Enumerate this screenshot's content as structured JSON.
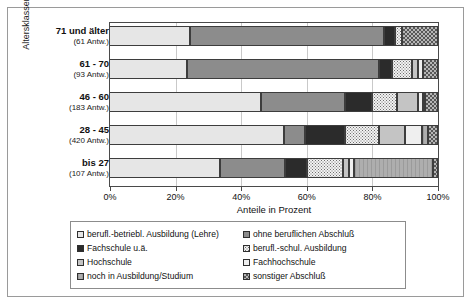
{
  "axis": {
    "y_title": "Altersklassen",
    "x_title": "Anteile in Prozent",
    "x_ticks": [
      "0%",
      "20%",
      "40%",
      "60%",
      "80%",
      "100%"
    ]
  },
  "categories": [
    {
      "name": "71 und älter",
      "count": "(61 Antw.)"
    },
    {
      "name": "61 - 70",
      "count": "(93 Antw.)"
    },
    {
      "name": "46 - 60",
      "count": "(183 Antw.)"
    },
    {
      "name": "28 - 45",
      "count": "(420 Antw.)"
    },
    {
      "name": "bis 27",
      "count": "(107 Antw.)"
    }
  ],
  "legend": [
    {
      "label": "berufl.-betriebl. Ausbildung (Lehre)",
      "swatch": "pattern-light-gray"
    },
    {
      "label": "ohne beruflichen Abschluß",
      "swatch": "pattern-mid-gray"
    },
    {
      "label": "Fachschule u.ä.",
      "swatch": "pattern-dark"
    },
    {
      "label": "berufl.-schul. Ausbildung",
      "swatch": "pattern-dotted"
    },
    {
      "label": "Hochschule",
      "swatch": "pattern-gray"
    },
    {
      "label": "Fachhochschule",
      "swatch": "pattern-white"
    },
    {
      "label": "noch in Ausbildung/Studium",
      "swatch": "pattern-vertical-lines"
    },
    {
      "label": "sonstiger Abschluß",
      "swatch": "pattern-checker"
    }
  ],
  "chart_data": {
    "type": "bar",
    "orientation": "horizontal",
    "stacked": "100%",
    "title": "",
    "xlabel": "Anteile in Prozent",
    "ylabel": "Altersklassen",
    "xlim": [
      0,
      100
    ],
    "xticks": [
      0,
      20,
      40,
      60,
      80,
      100
    ],
    "grid": "vertical",
    "legend_position": "bottom",
    "categories": [
      "71 und älter",
      "61 - 70",
      "46 - 60",
      "28 - 45",
      "bis 27"
    ],
    "category_counts": [
      61,
      93,
      183,
      420,
      107
    ],
    "series": [
      {
        "name": "berufl.-betriebl. Ausbildung (Lehre)",
        "values": [
          24.5,
          23.5,
          46.0,
          53.0,
          33.5
        ]
      },
      {
        "name": "ohne beruflichen Abschluß",
        "values": [
          59.0,
          58.5,
          25.5,
          6.5,
          20.0
        ]
      },
      {
        "name": "Fachschule u.ä.",
        "values": [
          3.5,
          4.0,
          8.5,
          12.0,
          6.5
        ]
      },
      {
        "name": "berufl.-schul. Ausbildung",
        "values": [
          2.0,
          6.0,
          7.5,
          10.5,
          11.0
        ]
      },
      {
        "name": "Hochschule",
        "values": [
          0.0,
          2.0,
          6.5,
          8.0,
          2.0
        ]
      },
      {
        "name": "Fachhochschule",
        "values": [
          0.0,
          1.5,
          1.5,
          5.0,
          1.5
        ]
      },
      {
        "name": "noch in Ausbildung/Studium",
        "values": [
          0.0,
          0.0,
          0.5,
          2.0,
          24.0
        ]
      },
      {
        "name": "sonstiger Abschluß",
        "values": [
          11.0,
          4.5,
          4.0,
          3.0,
          1.5
        ]
      }
    ]
  }
}
